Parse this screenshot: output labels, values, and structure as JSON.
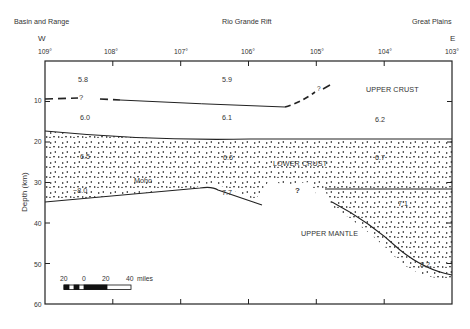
{
  "regions": {
    "left": "Basin and Range",
    "center": "Rio Grande Rift",
    "right": "Great Plains"
  },
  "directions": {
    "west": "W",
    "east": "E"
  },
  "x_axis": {
    "ticks": [
      "109°",
      "108°",
      "107°",
      "106°",
      "105°",
      "104°",
      "103°"
    ]
  },
  "y_axis": {
    "label": "Depth (km)",
    "ticks": [
      "10",
      "20",
      "30",
      "40",
      "50",
      "60"
    ]
  },
  "velocities": {
    "uc_top_left": "5.8",
    "uc_top_center": "5.9",
    "uc_low_left": "6.0",
    "uc_low_center": "6.1",
    "uc_low_right": "6.2",
    "lc_left": "6.5",
    "lc_center": "6.6",
    "lc_right": "6.7",
    "lc_deep_right": "7.1",
    "mantle_left": "~8.0",
    "mantle_center": "7.7",
    "mantle_right": "8.2"
  },
  "layer_labels": {
    "upper_crust": "UPPER CRUST",
    "lower_crust": "LOWER CRUST",
    "upper_mantle": "UPPER MANTLE",
    "moho": "Moho"
  },
  "uncertainty_marks": {
    "left_dashed": "?",
    "center_dashed": "?",
    "lower_crust": "?"
  },
  "scale_bar": {
    "labels": [
      "20",
      "0",
      "20",
      "40"
    ],
    "unit": "miles"
  }
}
